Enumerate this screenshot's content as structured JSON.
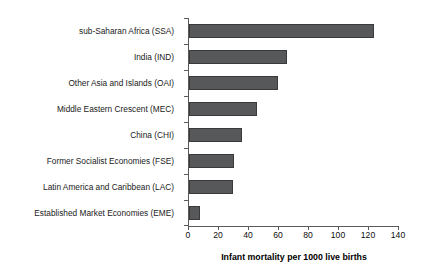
{
  "chart_data": {
    "type": "bar",
    "orientation": "horizontal",
    "title": "",
    "subtitle": "",
    "xlabel": "Infant mortality per 1000 live births",
    "ylabel": "",
    "categories": [
      "sub-Saharan Africa (SSA)",
      "India (IND)",
      "Other Asia and Islands (OAI)",
      "Middle Eastern Crescent (MEC)",
      "China (CHI)",
      "Former Socialist Economies (FSE)",
      "Latin America and Caribbean (LAC)",
      "Established Market Economies (EME)"
    ],
    "values": [
      123,
      65,
      59,
      45,
      35,
      30,
      29,
      7
    ],
    "xlim": [
      0,
      140
    ],
    "xticks": [
      0,
      20,
      40,
      60,
      80,
      100,
      120,
      140
    ],
    "xtick_labels": [
      "0",
      "20",
      "40",
      "60",
      "80",
      "100",
      "120",
      "140"
    ],
    "grid": false,
    "legend": null,
    "legend_position": "none",
    "bar_color": "#57585a",
    "bar_edge_color": "#3a3a3c",
    "axis_color": "#5a5a5a",
    "background": "#ffffff",
    "annotations": []
  }
}
